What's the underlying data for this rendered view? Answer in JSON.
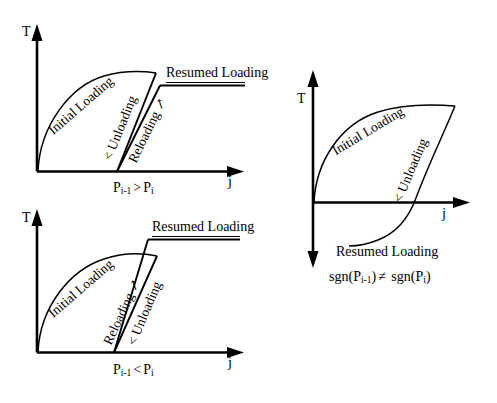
{
  "figure": {
    "kind": "stress-strain hysteresis diagram",
    "axis_labels": {
      "vertical": "T",
      "horizontal": "j"
    },
    "ink_color": "#000000",
    "background_color": "#ffffff"
  },
  "panels": [
    {
      "id": "panel-top-left",
      "caption": {
        "lhs": "P",
        "lhs_sub": "i-1",
        "operator": ">",
        "rhs": "P",
        "rhs_sub": "i",
        "full": "P i-1 > P i"
      },
      "axis_vertical_label": "T",
      "axis_horizontal_label": "j",
      "curves": [
        {
          "name": "Initial Loading",
          "label": "Initial Loading"
        },
        {
          "name": "Unloading",
          "label": "< Unloading"
        },
        {
          "name": "Reloading",
          "label": "Reloading ↗"
        },
        {
          "name": "Resumed Loading",
          "label": "Resumed Loading"
        }
      ]
    },
    {
      "id": "panel-bottom-left",
      "caption": {
        "lhs": "P",
        "lhs_sub": "i-1",
        "operator": "<",
        "rhs": "P",
        "rhs_sub": "i",
        "full": "P i-1 < P i"
      },
      "axis_vertical_label": "T",
      "axis_horizontal_label": "j",
      "curves": [
        {
          "name": "Initial Loading",
          "label": "Initial Loading"
        },
        {
          "name": "Reloading",
          "label": "Reloading ↗"
        },
        {
          "name": "Unloading",
          "label": "< Unloading"
        },
        {
          "name": "Resumed Loading",
          "label": "Resumed Loading"
        }
      ]
    },
    {
      "id": "panel-right",
      "caption": {
        "full": "sgn(P i-1 ) ≠ sgn(P i )",
        "fn": "sgn",
        "operator": "≠"
      },
      "axis_vertical_label": "T",
      "axis_horizontal_label": "j",
      "curves": [
        {
          "name": "Initial Loading",
          "label": "Initial Loading"
        },
        {
          "name": "Unloading",
          "label": "< Unloading"
        },
        {
          "name": "Resumed Loading",
          "label": "Resumed Loading"
        }
      ]
    }
  ],
  "text": {
    "initial_loading": "Initial Loading",
    "unloading": "< Unloading",
    "reloading": "Reloading ↗",
    "resumed_loading": "Resumed Loading",
    "t_axis": "T",
    "j_axis": "j",
    "p_symbol": "P",
    "sub_i_minus_1": "i-1",
    "sub_i": "i",
    "gt": ">",
    "lt": "<",
    "neq": "≠",
    "sgn_open": "sgn(",
    "paren_close": ")"
  }
}
